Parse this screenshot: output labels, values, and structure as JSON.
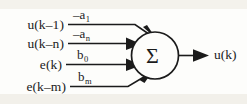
{
  "diagram": {
    "node_symbol": "Σ",
    "inputs": [
      {
        "signal": "u(k–1)",
        "weight_base": "–a",
        "weight_sub": "1"
      },
      {
        "signal": "u(k–n)",
        "weight_base": "–a",
        "weight_sub": "n"
      },
      {
        "signal": "e(k)",
        "weight_base": "b",
        "weight_sub": "0"
      },
      {
        "signal": "e(k–m)",
        "weight_base": "b",
        "weight_sub": "m"
      }
    ],
    "output": {
      "signal": "u(k)"
    },
    "colors": {
      "ink": "#1b1b1b",
      "paper": "#fdfdfb",
      "artifact": "#f2f0ea"
    }
  }
}
